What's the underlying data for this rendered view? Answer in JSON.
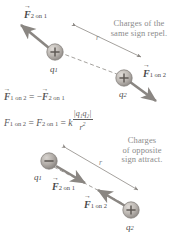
{
  "figure": {
    "background": "#ffffff",
    "annotation_color": "#8b8b8b",
    "charge_positive_color": "#b9b4b0",
    "charge_negative_color": "#a9a4a0",
    "arrow_color": "#8e8a86"
  },
  "top_panel": {
    "caption_line1": "Charges of the",
    "caption_line2": "same sign repel.",
    "charge1": {
      "label": "q",
      "subscript": "1",
      "sign": "+"
    },
    "charge2": {
      "label": "q",
      "subscript": "2",
      "sign": "+"
    },
    "force_on_1": {
      "symbol": "F",
      "sub": "2 on 1"
    },
    "force_on_2": {
      "symbol": "F",
      "sub": "1 on 2"
    },
    "distance_label": "r"
  },
  "equations": {
    "line1": {
      "lhs_symbol": "F",
      "lhs_sub": "1 on 2",
      "operator": "=",
      "rhs_sign": "−",
      "rhs_symbol": "F",
      "rhs_sub": "2 on 1"
    },
    "line2": {
      "first_symbol": "F",
      "first_sub": "1 on 2",
      "eq1": "=",
      "second_symbol": "F",
      "second_sub": "2 on 1",
      "eq2": "=",
      "constant": "k",
      "numerator": "|q₁q₂|",
      "denominator": "r",
      "denominator_exp": "2"
    }
  },
  "bottom_panel": {
    "caption_line1": "Charges",
    "caption_line2": "of opposite",
    "caption_line3": "sign attract.",
    "charge1": {
      "label": "q",
      "subscript": "1",
      "sign": "−"
    },
    "charge2": {
      "label": "q",
      "subscript": "2",
      "sign": "+"
    },
    "force_on_1": {
      "symbol": "F",
      "sub": "2 on 1"
    },
    "force_on_2": {
      "symbol": "F",
      "sub": "1 on 2"
    },
    "distance_label": "r"
  }
}
